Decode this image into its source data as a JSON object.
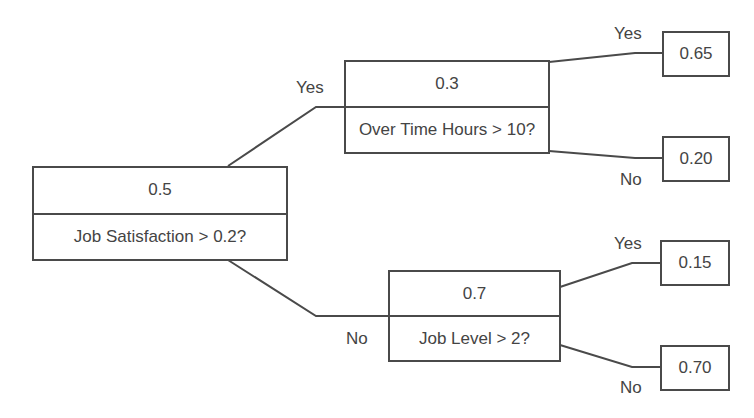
{
  "diagram": {
    "type": "decision-tree",
    "colors": {
      "line": "#4a4a4a",
      "text": "#444444",
      "background": "#ffffff"
    },
    "root": {
      "value": "0.5",
      "question": "Job Satisfaction > 0.2?"
    },
    "yes_branch": {
      "edge_label": "Yes",
      "value": "0.3",
      "question": "Over Time Hours > 10?",
      "yes": {
        "edge_label": "Yes",
        "value": "0.65"
      },
      "no": {
        "edge_label": "No",
        "value": "0.20"
      }
    },
    "no_branch": {
      "edge_label": "No",
      "value": "0.7",
      "question": "Job Level > 2?",
      "yes": {
        "edge_label": "Yes",
        "value": "0.15"
      },
      "no": {
        "edge_label": "No",
        "value": "0.70"
      }
    }
  }
}
